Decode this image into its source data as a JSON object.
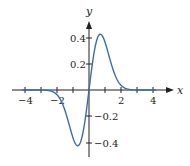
{
  "chart_data": {
    "type": "line",
    "title": "",
    "function": "y = x e^(-x^2)",
    "xlabel": "x",
    "ylabel": "y",
    "xlim": [
      -4.5,
      4.5
    ],
    "ylim": [
      -0.5,
      0.5
    ],
    "grid": false,
    "legend": null,
    "x_ticks": [
      -4,
      -3,
      -2,
      -1,
      0,
      1,
      2,
      3,
      4
    ],
    "x_tick_labels": [
      "−4",
      "",
      "−2",
      "",
      "",
      "",
      "2",
      "",
      "4"
    ],
    "y_ticks": [
      0.4,
      0.2,
      -0.2,
      -0.4
    ],
    "y_tick_labels": [
      "0.4",
      "0.2",
      "−0.2",
      "−0.4"
    ],
    "series": [
      {
        "name": "curve",
        "color": "#3a6cb4",
        "x": [
          -4,
          -3,
          -2.5,
          -2,
          -1.5,
          -1,
          -0.707,
          -0.5,
          0,
          0.5,
          0.707,
          1,
          1.5,
          2,
          2.5,
          3,
          4
        ],
        "y": [
          0,
          -0.0004,
          -0.0048,
          -0.0366,
          -0.158,
          -0.368,
          -0.429,
          -0.389,
          0,
          0.389,
          0.429,
          0.368,
          0.158,
          0.0366,
          0.0048,
          0.0004,
          0
        ]
      }
    ],
    "extrema": {
      "max": {
        "x": 0.707,
        "y": 0.429
      },
      "min": {
        "x": -0.707,
        "y": -0.429
      }
    }
  },
  "labels": {
    "x_axis": "x",
    "y_axis": "y",
    "xt_m4": "−4",
    "xt_m2": "−2",
    "xt_2": "2",
    "xt_4": "4",
    "yt_04": "0.4",
    "yt_02": "0.2",
    "yt_m02": "−0.2",
    "yt_m04": "−0.4"
  }
}
